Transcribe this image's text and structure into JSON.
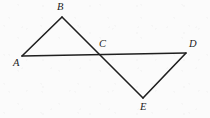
{
  "figure": {
    "background_color": "#fbfbfb",
    "stroke_color": "#1f1f1f",
    "label_color": "#1c1c1c",
    "stroke_width": 1.6,
    "width": 210,
    "height": 118,
    "points": {
      "A": {
        "label": "A",
        "x": 22,
        "y": 56,
        "label_x": 13,
        "label_y": 58
      },
      "B": {
        "label": "B",
        "x": 62,
        "y": 17,
        "label_x": 57,
        "label_y": 2
      },
      "C": {
        "label": "C",
        "x": 100,
        "y": 54,
        "label_x": 99,
        "label_y": 39
      },
      "D": {
        "label": "D",
        "x": 186,
        "y": 53,
        "label_x": 189,
        "label_y": 39
      },
      "E": {
        "label": "E",
        "x": 143,
        "y": 98,
        "label_x": 140,
        "label_y": 102
      }
    },
    "segments": [
      {
        "name": "segment-AB",
        "from": "A",
        "to": "B",
        "path": "22,56 62,17"
      },
      {
        "name": "segment-BE",
        "from": "B",
        "to": "E",
        "path": "62,17 143,98"
      },
      {
        "name": "segment-AD",
        "from": "A",
        "to": "D",
        "path": "22,56 186,53"
      },
      {
        "name": "segment-ED",
        "from": "E",
        "to": "D",
        "path": "143,98 186,53"
      }
    ],
    "triangles": [
      {
        "name": "triangle-ABC",
        "vertices": "A, B, C"
      },
      {
        "name": "triangle-CDE",
        "vertices": "C, D, E"
      }
    ]
  }
}
